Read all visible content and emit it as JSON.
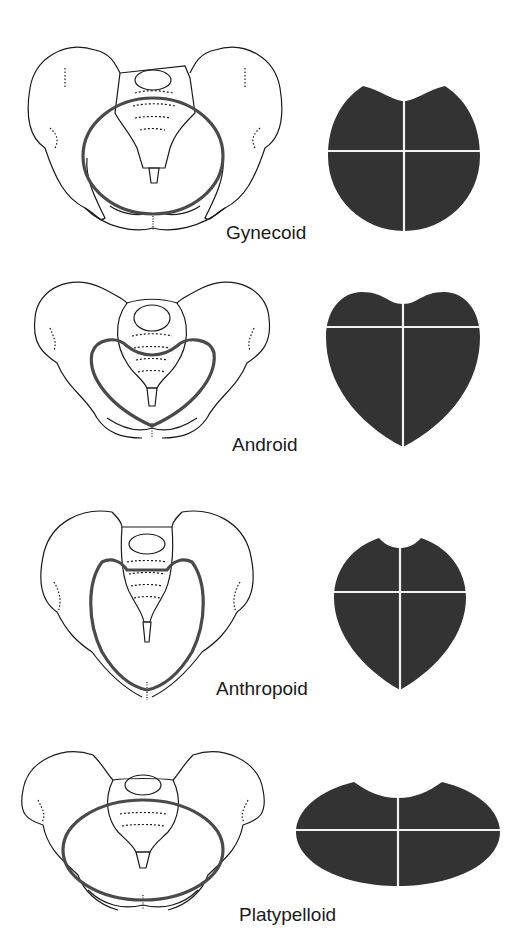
{
  "figure": {
    "colors": {
      "outline": "#1a1a1a",
      "inlet_ring": "#4a4a4a",
      "inlet_fill": "#333333",
      "divider": "#f2f2f2",
      "background": "#ffffff"
    },
    "panels": [
      {
        "id": "gynecoid",
        "label": "Gynecoid",
        "inlet_shape": "round"
      },
      {
        "id": "android",
        "label": "Android",
        "inlet_shape": "heart"
      },
      {
        "id": "anthropoid",
        "label": "Anthropoid",
        "inlet_shape": "oval-long"
      },
      {
        "id": "platypelloid",
        "label": "Platypelloid",
        "inlet_shape": "oval-flat"
      }
    ]
  }
}
